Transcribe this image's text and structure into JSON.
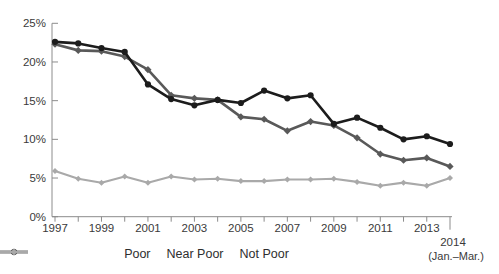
{
  "chart_data": {
    "type": "line",
    "title": "",
    "xlabel": "",
    "ylabel": "",
    "x": [
      1997,
      1998,
      1999,
      2000,
      2001,
      2002,
      2003,
      2004,
      2005,
      2006,
      2007,
      2008,
      2009,
      2010,
      2011,
      2012,
      2013,
      2014
    ],
    "x_labeled_ticks": [
      1997,
      1999,
      2001,
      2003,
      2005,
      2007,
      2009,
      2011,
      2013
    ],
    "final_tick_label": "2014",
    "final_tick_note": "(Jan.–Mar.)",
    "ylim": [
      0,
      25
    ],
    "ytick_step": 5,
    "ytick_suffix": "%",
    "grid": false,
    "legend_position": "bottom",
    "series": [
      {
        "name": "Poor",
        "color": "#595959",
        "marker": "diamond",
        "values": [
          22.3,
          21.5,
          21.4,
          20.7,
          19.0,
          15.7,
          15.3,
          15.1,
          12.9,
          12.6,
          11.1,
          12.3,
          11.8,
          10.2,
          8.1,
          7.3,
          7.6,
          6.5
        ]
      },
      {
        "name": "Near Poor",
        "color": "#1c1c1c",
        "marker": "circle",
        "values": [
          22.6,
          22.4,
          21.8,
          21.3,
          17.1,
          15.2,
          14.4,
          15.1,
          14.7,
          16.3,
          15.3,
          15.7,
          12.0,
          12.8,
          11.5,
          10.0,
          10.4,
          9.4
        ]
      },
      {
        "name": "Not Poor",
        "color": "#a9a9a9",
        "marker": "diamond",
        "values": [
          5.9,
          4.9,
          4.4,
          5.2,
          4.4,
          5.2,
          4.8,
          4.9,
          4.6,
          4.6,
          4.8,
          4.8,
          4.9,
          4.5,
          4.0,
          4.4,
          4.0,
          5.0
        ]
      }
    ],
    "axis_color": "#8c8c8c"
  }
}
